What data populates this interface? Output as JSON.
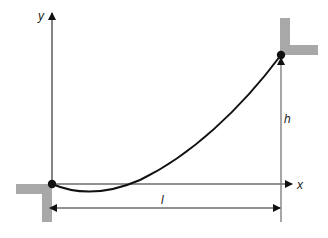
{
  "diagram": {
    "type": "cable-span-between-supports",
    "labels": {
      "y_axis": "y",
      "x_axis": "x",
      "span": "l",
      "height": "h"
    },
    "colors": {
      "support": "#a8a8a8",
      "curve": "#111111",
      "axis": "#222222",
      "guide": "#777777"
    }
  }
}
